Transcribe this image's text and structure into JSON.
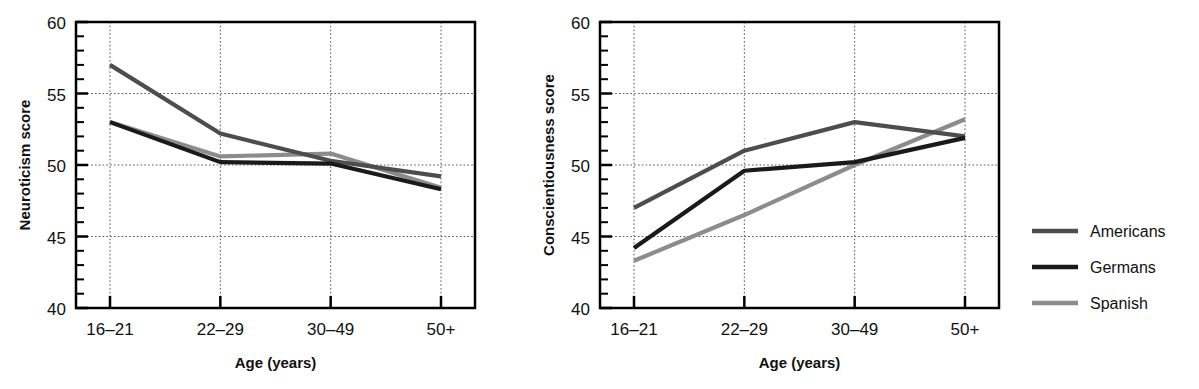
{
  "chart_data": [
    {
      "type": "line",
      "title": "",
      "xlabel": "Age (years)",
      "ylabel": "Neuroticism score",
      "categories": [
        "16–21",
        "22–29",
        "30–49",
        "50+"
      ],
      "ylim": [
        40,
        60
      ],
      "yticks": [
        40,
        45,
        50,
        55,
        60
      ],
      "ytick_labels": [
        "40",
        "45",
        "50",
        "55",
        "60"
      ],
      "minor_tick_step": 1,
      "grid": "dotted major x and y",
      "legend_position": "right, outside",
      "series": [
        {
          "name": "Americans",
          "color": "#4d4d4d",
          "values": [
            57.0,
            52.2,
            50.3,
            49.2
          ]
        },
        {
          "name": "Germans",
          "color": "#1a1a1a",
          "values": [
            53.0,
            50.2,
            50.1,
            48.3
          ]
        },
        {
          "name": "Spanish",
          "color": "#8c8c8c",
          "values": [
            53.0,
            50.6,
            50.8,
            48.4
          ]
        }
      ]
    },
    {
      "type": "line",
      "title": "",
      "xlabel": "Age (years)",
      "ylabel": "Conscientiousness score",
      "categories": [
        "16–21",
        "22–29",
        "30–49",
        "50+"
      ],
      "ylim": [
        40,
        60
      ],
      "yticks": [
        40,
        45,
        50,
        55,
        60
      ],
      "ytick_labels": [
        "40",
        "45",
        "50",
        "55",
        "60"
      ],
      "minor_tick_step": 1,
      "grid": "dotted major x and y",
      "legend_position": "right, outside",
      "series": [
        {
          "name": "Americans",
          "color": "#4d4d4d",
          "values": [
            47.0,
            51.0,
            53.0,
            52.0
          ]
        },
        {
          "name": "Germans",
          "color": "#1a1a1a",
          "values": [
            44.2,
            49.6,
            50.2,
            51.9
          ]
        },
        {
          "name": "Spanish",
          "color": "#8c8c8c",
          "values": [
            43.3,
            46.5,
            50.0,
            53.2
          ]
        }
      ]
    }
  ],
  "left_chart": {
    "ylabel": "Neuroticism score",
    "xlabel": "Age (years)",
    "ytick_labels": [
      "60",
      "55",
      "50",
      "45",
      "40"
    ],
    "xtick_labels": [
      "16–21",
      "22–29",
      "30–49",
      "50+"
    ]
  },
  "right_chart": {
    "ylabel": "Conscientiousness score",
    "xlabel": "Age (years)",
    "ytick_labels": [
      "60",
      "55",
      "50",
      "45",
      "40"
    ],
    "xtick_labels": [
      "16–21",
      "22–29",
      "30–49",
      "50+"
    ]
  },
  "legend": {
    "entries": [
      {
        "label": "Americans",
        "color": "#4d4d4d"
      },
      {
        "label": "Germans",
        "color": "#1a1a1a"
      },
      {
        "label": "Spanish",
        "color": "#8c8c8c"
      }
    ]
  }
}
